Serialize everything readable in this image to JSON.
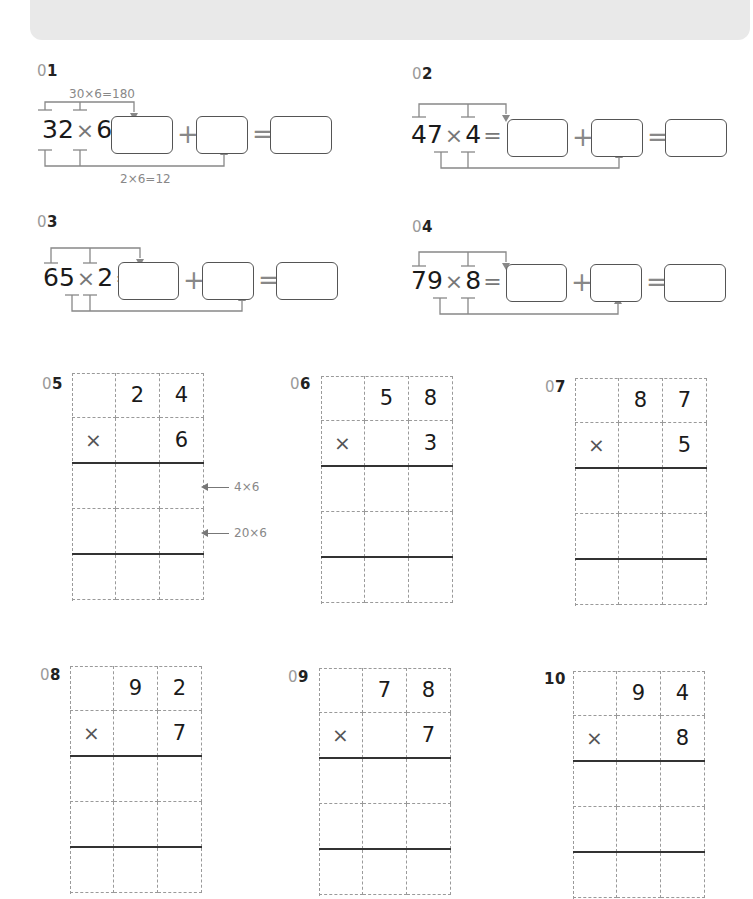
{
  "header_bar": {
    "color": "#e9e9e9"
  },
  "split_problems": [
    {
      "number_prefix": "0",
      "number_suffix": "1",
      "factor_a": "32",
      "factor_b": "6",
      "times": "×",
      "equals": "=",
      "plus": "+",
      "hint_top": "30×6=180",
      "hint_bottom": "2×6=12"
    },
    {
      "number_prefix": "0",
      "number_suffix": "2",
      "factor_a": "47",
      "factor_b": "4",
      "times": "×",
      "equals": "=",
      "plus": "+",
      "hint_top": "",
      "hint_bottom": ""
    },
    {
      "number_prefix": "0",
      "number_suffix": "3",
      "factor_a": "65",
      "factor_b": "2",
      "times": "×",
      "equals": "=",
      "plus": "+",
      "hint_top": "",
      "hint_bottom": ""
    },
    {
      "number_prefix": "0",
      "number_suffix": "4",
      "factor_a": "79",
      "factor_b": "8",
      "times": "×",
      "equals": "=",
      "plus": "+",
      "hint_top": "",
      "hint_bottom": ""
    }
  ],
  "grid_problems": [
    {
      "number_prefix": "0",
      "number_suffix": "5",
      "tens": "2",
      "ones": "4",
      "times": "×",
      "multiplier": "6",
      "note_1": "4×6",
      "note_2": "20×6"
    },
    {
      "number_prefix": "0",
      "number_suffix": "6",
      "tens": "5",
      "ones": "8",
      "times": "×",
      "multiplier": "3"
    },
    {
      "number_prefix": "0",
      "number_suffix": "7",
      "tens": "8",
      "ones": "7",
      "times": "×",
      "multiplier": "5"
    },
    {
      "number_prefix": "0",
      "number_suffix": "8",
      "tens": "9",
      "ones": "2",
      "times": "×",
      "multiplier": "7"
    },
    {
      "number_prefix": "0",
      "number_suffix": "9",
      "tens": "7",
      "ones": "8",
      "times": "×",
      "multiplier": "7"
    },
    {
      "number_prefix": "",
      "number_suffix": "10",
      "tens": "9",
      "ones": "4",
      "times": "×",
      "multiplier": "8"
    }
  ]
}
